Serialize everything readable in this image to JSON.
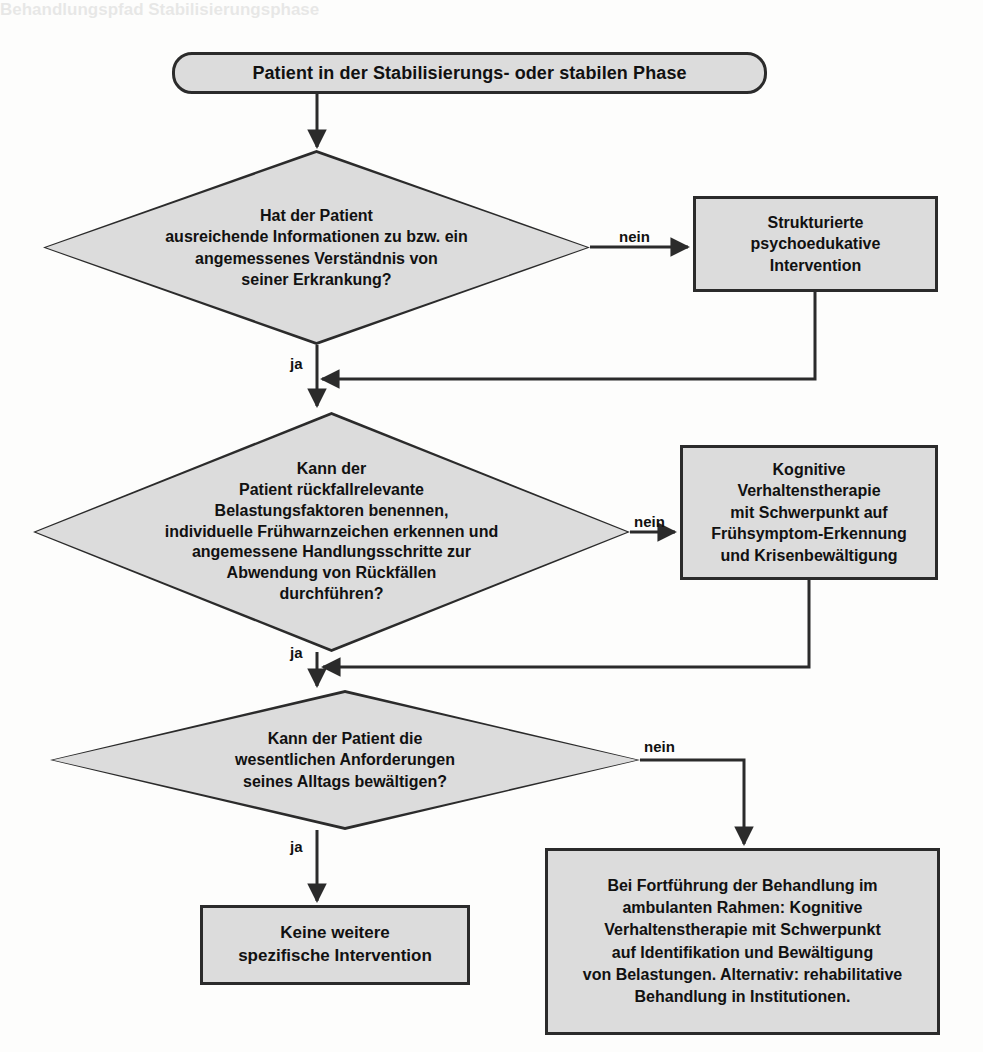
{
  "diagram": {
    "title": "Behandlungspfad Stabilisierungsphase",
    "language": "de",
    "colors": {
      "node_fill": "#dcdcdc",
      "node_stroke": "#2b2b2b",
      "text": "#111111",
      "background": "#fdfdfc"
    }
  },
  "nodes": {
    "start": {
      "shape": "rounded-rectangle",
      "text": "Patient in der Stabilisierungs- oder stabilen Phase"
    },
    "decision1": {
      "shape": "diamond",
      "text": "Hat der Patient\nausreichende Informationen zu bzw. ein\nangemessenes Verständnis von\nseiner Erkrankung?"
    },
    "action1": {
      "shape": "rectangle",
      "text": "Strukturierte\npsychoedukative\nIntervention"
    },
    "decision2": {
      "shape": "diamond",
      "text": "Kann der\nPatient rückfallrelevante\nBelastungsfaktoren benennen,\nindividuelle Frühwarnzeichen erkennen  und\nangemessene Handlungsschritte zur\nAbwendung von Rückfällen\ndurchführen?"
    },
    "action2": {
      "shape": "rectangle",
      "text": "Kognitive\nVerhaltenstherapie\nmit Schwerpunkt auf\nFrühsymptom-Erkennung\nund Krisenbewältigung"
    },
    "decision3": {
      "shape": "diamond",
      "text": "Kann der Patient die\nwesentlichen Anforderungen\nseines Alltags bewältigen?"
    },
    "outcome_yes": {
      "shape": "rectangle",
      "text": "Keine weitere\nspezifische Intervention"
    },
    "outcome_no": {
      "shape": "rectangle",
      "text": "Bei Fortführung der Behandlung im\nambulanten Rahmen: Kognitive\nVerhaltenstherapie mit Schwerpunkt\nauf Identifikation und Bewältigung\nvon Belastungen. Alternativ: rehabilitative\nBehandlung in Institutionen."
    }
  },
  "edges": {
    "d1_no": "nein",
    "d1_yes": "ja",
    "d2_no": "nein",
    "d2_yes": "ja",
    "d3_no": "nein",
    "d3_yes": "ja"
  }
}
